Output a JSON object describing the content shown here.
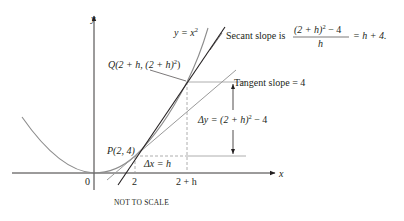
{
  "figure": {
    "axis_x_label": "x",
    "axis_y_label": "y",
    "origin_label": "0",
    "tick_2_label": "2",
    "tick_2h_label": "2 + h",
    "curve_label_prefix": "y = x",
    "curve_label_exp": "2",
    "point_p_label": "P(2, 4)",
    "point_q_label_a": "Q(2 + h, (2 + h)",
    "point_q_label_exp": "2",
    "point_q_label_b": ")",
    "secant_label_prefix": "Secant slope is",
    "secant_numerator_a": "(2 + h)",
    "secant_numerator_exp": "2",
    "secant_numerator_b": " − 4",
    "secant_denominator": "h",
    "secant_result": "= h + 4.",
    "tangent_label": "Tangent slope = 4",
    "delta_y_label_a": "Δy = (2 + h)",
    "delta_y_label_exp": "2",
    "delta_y_label_b": " − 4",
    "delta_x_label": "Δx = h",
    "footnote": "NOT TO SCALE",
    "colors": {
      "curve": "#8c8c8c",
      "secant": "#231f20",
      "tangent": "#9a9a9a",
      "axes": "#231f20",
      "dashed": "#9a9a9a"
    }
  }
}
